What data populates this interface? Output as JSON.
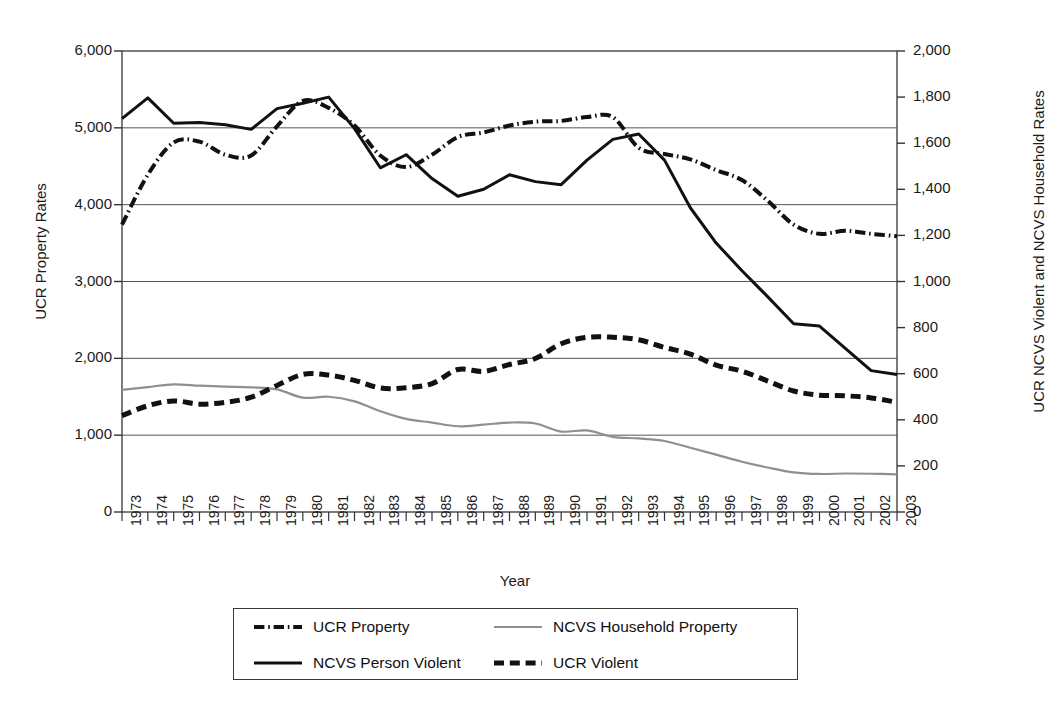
{
  "chart_data": {
    "type": "line",
    "title": "",
    "xlabel": "Year",
    "ylabel": "UCR Property Rates",
    "ylabel_right": "UCR NCVS Violent and NCVS Household Rates",
    "grid": true,
    "legend_position": "bottom",
    "x": [
      1973,
      1974,
      1975,
      1976,
      1977,
      1978,
      1979,
      1980,
      1981,
      1982,
      1983,
      1984,
      1985,
      1986,
      1987,
      1988,
      1989,
      1990,
      1991,
      1992,
      1993,
      1994,
      1995,
      1996,
      1997,
      1998,
      1999,
      2000,
      2001,
      2002,
      2003
    ],
    "categories": [
      "1973",
      "1974",
      "1975",
      "1976",
      "1977",
      "1978",
      "1979",
      "1980",
      "1981",
      "1982",
      "1983",
      "1984",
      "1985",
      "1986",
      "1987",
      "1988",
      "1989",
      "1990",
      "1991",
      "1992",
      "1993",
      "1994",
      "1995",
      "1996",
      "1997",
      "1998",
      "1999",
      "2000",
      "2001",
      "2002",
      "2003"
    ],
    "ylim": [
      0,
      6000
    ],
    "yticks": [
      "0",
      "1,000",
      "2,000",
      "3,000",
      "4,000",
      "5,000",
      "6,000"
    ],
    "ylim_right": [
      0,
      2000
    ],
    "yticks_right": [
      "0",
      "200",
      "400",
      "600",
      "800",
      "1,000",
      "1,200",
      "1,400",
      "1,600",
      "1,800",
      "2,000"
    ],
    "series": [
      {
        "name": "UCR Property",
        "axis": "left",
        "style": "dash-dot",
        "color": "#111111",
        "width": 4.0,
        "values": [
          3740,
          4390,
          4810,
          4820,
          4650,
          4640,
          5020,
          5350,
          5260,
          5030,
          4640,
          4490,
          4650,
          4880,
          4940,
          5030,
          5080,
          5090,
          5140,
          5140,
          4740,
          4660,
          4590,
          4450,
          4320,
          4050,
          3740,
          3620,
          3660,
          3620,
          3590
        ]
      },
      {
        "name": "NCVS Household Property",
        "axis": "right",
        "style": "solid-thin",
        "color": "#8f8f8f",
        "width": 2.2,
        "values": [
          530,
          542,
          554,
          548,
          544,
          541,
          532,
          496,
          500,
          480,
          437,
          404,
          388,
          372,
          379,
          388,
          384,
          349,
          354,
          326,
          319,
          308,
          279,
          249,
          218,
          193,
          172,
          165,
          167,
          166,
          163
        ]
      },
      {
        "name": "NCVS Person Violent",
        "axis": "left",
        "style": "solid",
        "color": "#111111",
        "width": 3.0,
        "values": [
          5120,
          5390,
          5060,
          5070,
          5040,
          4980,
          5250,
          5320,
          5400,
          4990,
          4480,
          4650,
          4340,
          4110,
          4200,
          4390,
          4300,
          4260,
          4580,
          4850,
          4920,
          4580,
          3960,
          3500,
          3140,
          2800,
          2450,
          2420,
          2130,
          1840,
          1790
        ]
      },
      {
        "name": "UCR Violent",
        "axis": "right",
        "style": "dashed",
        "color": "#111111",
        "width": 5.0,
        "values": [
          418,
          461,
          482,
          468,
          476,
          498,
          549,
          597,
          594,
          571,
          538,
          539,
          557,
          618,
          610,
          640,
          666,
          730,
          758,
          758,
          747,
          714,
          685,
          637,
          611,
          568,
          525,
          507,
          504,
          495,
          476
        ]
      }
    ]
  },
  "legend": {
    "items": [
      {
        "label": "UCR Property",
        "style": "dash-dot",
        "color": "#111111"
      },
      {
        "label": "NCVS Household Property",
        "style": "solid-thin",
        "color": "#8f8f8f"
      },
      {
        "label": "NCVS Person Violent",
        "style": "solid",
        "color": "#111111"
      },
      {
        "label": "UCR Violent",
        "style": "dashed",
        "color": "#111111"
      }
    ]
  }
}
